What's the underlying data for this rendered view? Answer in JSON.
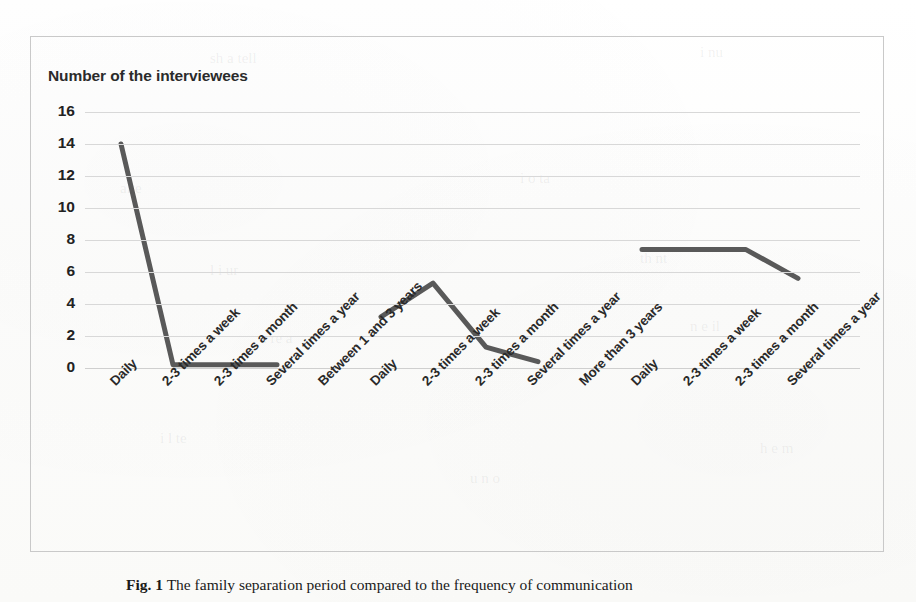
{
  "figure": {
    "caption_number": "Fig. 1",
    "caption_text": "The family separation period compared to the frequency of communication"
  },
  "chart_data": {
    "type": "line",
    "title": "",
    "axis_title": "Number of the interviewees",
    "xlabel": "",
    "ylabel": "Number of the interviewees",
    "ylim": [
      0,
      16
    ],
    "ytick_step": 2,
    "yticks": [
      "16",
      "14",
      "12",
      "10",
      "8",
      "6",
      "4",
      "2",
      "0"
    ],
    "grid": true,
    "legend": "none",
    "line_color": "#595959",
    "line_width": 5,
    "categories": [
      "Daily",
      "2-3 times a week",
      "2-3 times a month",
      "Several times a year",
      "Between 1 and 3 years",
      "Daily",
      "2-3 times a week",
      "2-3 times a month",
      "Several times a year",
      "More than 3 years",
      "Daily",
      "2-3 times a week",
      "2-3 times a month",
      "Several times a year"
    ],
    "values": [
      14,
      0.2,
      0.2,
      0.2,
      null,
      3.2,
      5.3,
      1.3,
      0.4,
      null,
      7.4,
      7.4,
      7.4,
      5.6
    ],
    "groups": [
      {
        "name": "Less than 1 year",
        "categories": [
          "Daily",
          "2-3 times a week",
          "2-3 times a month",
          "Several times a year"
        ],
        "values": [
          14,
          0.2,
          0.2,
          0.2
        ]
      },
      {
        "name": "Between 1 and 3 years",
        "categories": [
          "Daily",
          "2-3 times a week",
          "2-3 times a month",
          "Several times a year"
        ],
        "values": [
          3.2,
          5.3,
          1.3,
          0.4
        ]
      },
      {
        "name": "More than 3 years",
        "categories": [
          "Daily",
          "2-3 times a week",
          "2-3 times a month",
          "Several times a year"
        ],
        "values": [
          7.4,
          7.4,
          7.4,
          5.6
        ]
      }
    ]
  },
  "ghost_marks": [
    {
      "text": "sh a tell",
      "x": 210,
      "y": 50
    },
    {
      "text": "i nu",
      "x": 700,
      "y": 44
    },
    {
      "text": "alte",
      "x": 120,
      "y": 180
    },
    {
      "text": "i o ta",
      "x": 520,
      "y": 170
    },
    {
      "text": "l i ur",
      "x": 210,
      "y": 262
    },
    {
      "text": "th nt",
      "x": 640,
      "y": 250
    },
    {
      "text": "a re a",
      "x": 260,
      "y": 330
    },
    {
      "text": "n e il",
      "x": 690,
      "y": 318
    },
    {
      "text": "i l te",
      "x": 160,
      "y": 430
    },
    {
      "text": "u n o",
      "x": 470,
      "y": 470
    },
    {
      "text": "h e m",
      "x": 760,
      "y": 440
    }
  ]
}
